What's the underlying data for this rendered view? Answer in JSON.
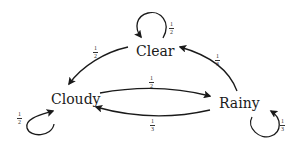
{
  "diagram": {
    "type": "markov-chain",
    "nodes": [
      {
        "id": "clear",
        "label": "Clear"
      },
      {
        "id": "cloudy",
        "label": "Cloudy"
      },
      {
        "id": "rainy",
        "label": "Rainy"
      }
    ],
    "edges": [
      {
        "from": "clear",
        "to": "clear",
        "label_num": "1",
        "label_den": "2"
      },
      {
        "from": "clear",
        "to": "cloudy",
        "label_num": "1",
        "label_den": "2"
      },
      {
        "from": "rainy",
        "to": "clear",
        "label_num": "1",
        "label_den": "3"
      },
      {
        "from": "cloudy",
        "to": "rainy",
        "label_num": "1",
        "label_den": "2"
      },
      {
        "from": "rainy",
        "to": "cloudy",
        "label_num": "1",
        "label_den": "3"
      },
      {
        "from": "cloudy",
        "to": "cloudy",
        "label_num": "1",
        "label_den": "2"
      },
      {
        "from": "rainy",
        "to": "rainy",
        "label_num": "1",
        "label_den": "3"
      }
    ],
    "colors": {
      "edge": "#1a1a1a",
      "text": "#1a1a1a",
      "background": "#ffffff"
    }
  }
}
